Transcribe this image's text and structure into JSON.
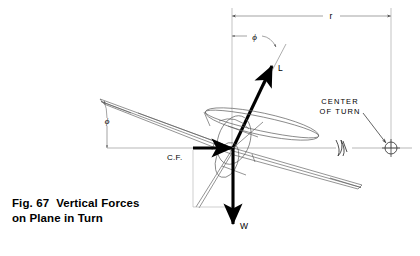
{
  "figure": {
    "caption_label": "Fig. 67",
    "caption_line1": "Vertical Forces",
    "caption_line2": "on Plane in Turn",
    "background_color": "#ffffff",
    "ink_color": "#000000",
    "thin_line_color": "#888888"
  },
  "labels": {
    "radius": "r",
    "bank_angle_top": "ϕ",
    "bank_angle_left": "ϕ",
    "lift_vector": "L",
    "weight_vector": "W",
    "centrifugal_force": "C.F.",
    "center_of_turn_line1": "CENTER",
    "center_of_turn_line2": "OF TURN"
  },
  "icons": {
    "center_of_turn_symbol": "crosshair-circle-icon",
    "break_symbol": "line-break-icon",
    "lift_arrow": "arrow-up-right-icon",
    "weight_arrow": "arrow-down-icon",
    "cf_arrow": "arrow-right-icon",
    "dimension_arrow_left": "arrow-left-icon",
    "dimension_arrow_right": "arrow-right-icon"
  },
  "geometry": {
    "aircraft_center_x": 233,
    "aircraft_center_y": 148,
    "center_of_turn_x": 391,
    "center_of_turn_y": 146,
    "radius_dimension_y": 16,
    "bank_angle_degrees": 25
  }
}
